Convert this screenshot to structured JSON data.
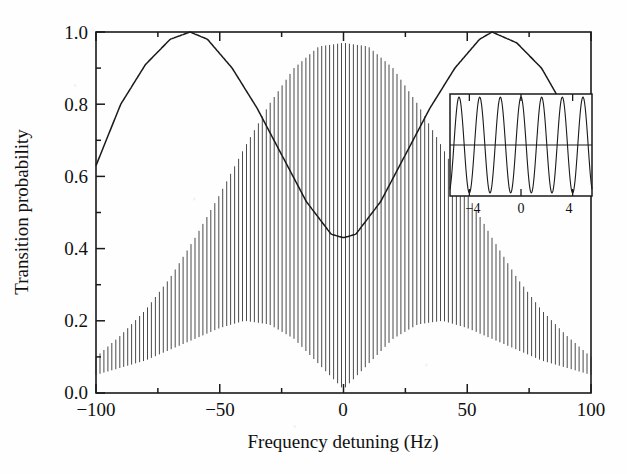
{
  "figure": {
    "name": "ramsey-fringes-plot",
    "background_color": "#fefefe",
    "ink_color": "#1a1a1a"
  },
  "axes": {
    "x_label": "Frequency detuning (Hz)",
    "y_label": "Transition probability",
    "x_ticklabels": [
      "−100",
      "−50",
      "0",
      "50",
      "100"
    ],
    "y_ticklabels": [
      "0.0",
      "0.2",
      "0.4",
      "0.6",
      "0.8",
      "1.0"
    ]
  },
  "inset": {
    "x_ticklabels": [
      "−4",
      "0",
      "4"
    ]
  },
  "chart_data": {
    "type": "line",
    "title": "",
    "xlabel": "Frequency detuning (Hz)",
    "ylabel": "Transition probability",
    "xlim": [
      -100,
      100
    ],
    "ylim": [
      0.0,
      1.0
    ],
    "xticks": [
      -100,
      -50,
      0,
      50,
      100
    ],
    "xminorticks": [
      -75,
      -25,
      25,
      75
    ],
    "yticks": [
      0.0,
      0.2,
      0.4,
      0.6,
      0.8,
      1.0
    ],
    "grid": false,
    "legend": null,
    "series": [
      {
        "name": "Rabi envelope (smooth slow curve)",
        "description": "Broad smooth oscillation, maxima 1.0 near −62 Hz and +60 Hz, minimum 0.43 at 0 Hz, value 0.63 at both −100 Hz and +100 Hz",
        "x": [
          -100,
          -90,
          -80,
          -70,
          -62,
          -55,
          -45,
          -35,
          -25,
          -15,
          -5,
          0,
          5,
          15,
          25,
          35,
          45,
          55,
          60,
          70,
          80,
          90,
          100
        ],
        "values": [
          0.63,
          0.8,
          0.91,
          0.98,
          1.0,
          0.98,
          0.9,
          0.79,
          0.66,
          0.53,
          0.44,
          0.43,
          0.44,
          0.53,
          0.66,
          0.79,
          0.9,
          0.98,
          1.0,
          0.97,
          0.9,
          0.78,
          0.63
        ]
      },
      {
        "name": "Ramsey fringes upper envelope",
        "description": "Upper bound of the dense fast fringe pattern",
        "x": [
          -100,
          -90,
          -80,
          -70,
          -60,
          -50,
          -40,
          -30,
          -20,
          -10,
          0,
          10,
          20,
          30,
          40,
          50,
          60,
          70,
          80,
          90,
          100
        ],
        "values": [
          0.1,
          0.16,
          0.23,
          0.32,
          0.43,
          0.55,
          0.68,
          0.8,
          0.9,
          0.96,
          0.97,
          0.96,
          0.9,
          0.8,
          0.68,
          0.55,
          0.43,
          0.32,
          0.23,
          0.16,
          0.1
        ]
      },
      {
        "name": "Ramsey fringes lower envelope",
        "description": "Lower bound of the dense fast fringe pattern",
        "x": [
          -100,
          -90,
          -80,
          -70,
          -60,
          -50,
          -40,
          -30,
          -20,
          -10,
          0,
          10,
          20,
          30,
          40,
          50,
          60,
          70,
          80,
          90,
          100
        ],
        "values": [
          0.05,
          0.07,
          0.09,
          0.12,
          0.15,
          0.18,
          0.2,
          0.19,
          0.15,
          0.08,
          0.01,
          0.08,
          0.15,
          0.19,
          0.2,
          0.18,
          0.15,
          0.12,
          0.09,
          0.07,
          0.05
        ]
      },
      {
        "name": "Ramsey fringes (fast oscillation)",
        "description": "Fast cosine fringes of period about 1.6 Hz filling the region between the upper and lower envelopes across the full −100 to 100 Hz range",
        "fringe_period_hz": 1.6,
        "approx_fringe_count": 125
      }
    ],
    "inset": {
      "type": "line",
      "description": "Magnified view of the central fringes around zero detuning",
      "xlim": [
        -5.5,
        5.5
      ],
      "ylim": [
        0.0,
        1.0
      ],
      "xticks": [
        -4,
        0,
        4
      ],
      "fringe_period_hz": 1.6,
      "midline_y": 0.5,
      "amplitude": 0.47
    }
  }
}
